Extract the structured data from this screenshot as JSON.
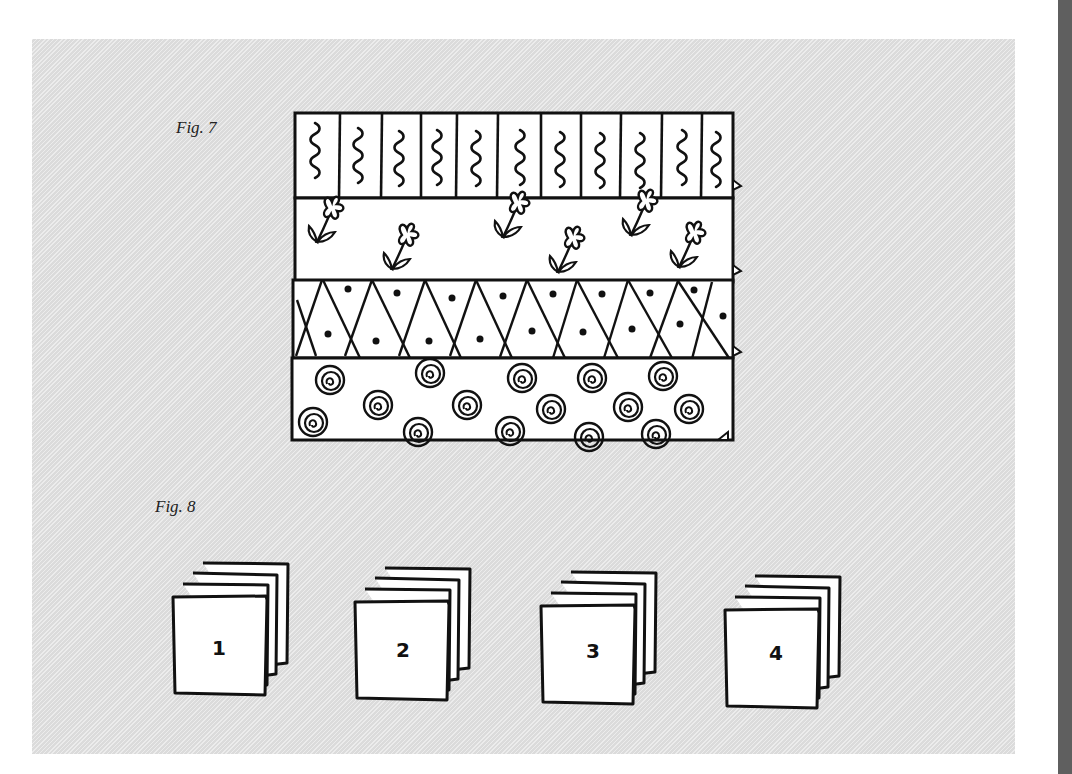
{
  "figures": [
    {
      "label": "Fig. 7",
      "description": "Four horizontal fabric strips sewn together",
      "strips": [
        {
          "pattern": "vertical-stripes-with-squiggles"
        },
        {
          "pattern": "flowers"
        },
        {
          "pattern": "diamond-lattice-with-dots"
        },
        {
          "pattern": "spirals"
        }
      ]
    },
    {
      "label": "Fig. 8",
      "description": "Four stacks of cut squares",
      "stacks": [
        {
          "number": "1"
        },
        {
          "number": "2"
        },
        {
          "number": "3"
        },
        {
          "number": "4"
        }
      ]
    }
  ],
  "colors": {
    "panel": "#e2e2e2",
    "ink": "#111111",
    "paper": "#ffffff",
    "edge": "#5f5f5f"
  }
}
